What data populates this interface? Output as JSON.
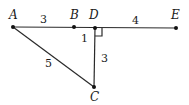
{
  "diagram": {
    "type": "geometry",
    "points": [
      {
        "id": "A",
        "label": "A",
        "x": 13,
        "y": 27
      },
      {
        "id": "B",
        "label": "B",
        "x": 74,
        "y": 27
      },
      {
        "id": "D",
        "label": "D",
        "x": 95,
        "y": 28
      },
      {
        "id": "E",
        "label": "E",
        "x": 176,
        "y": 28
      },
      {
        "id": "C",
        "label": "C",
        "x": 94,
        "y": 87
      }
    ],
    "segments": [
      {
        "from": "A",
        "to": "E",
        "note": "line A-B-D-E"
      },
      {
        "from": "A",
        "to": "C"
      },
      {
        "from": "D",
        "to": "C"
      }
    ],
    "lengths": {
      "AB": "3",
      "DE": "4",
      "AC": "5",
      "DC": "3",
      "BD": "1"
    },
    "right_angle_at": "D",
    "colors": {
      "stroke": "#2a2a2a",
      "text": "#1a1a1a",
      "background": "#ffffff"
    }
  }
}
